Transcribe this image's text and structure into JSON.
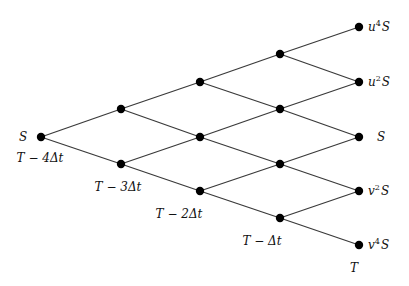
{
  "diagram": {
    "type": "binomial-tree",
    "steps": 4,
    "root_label": "S",
    "root_time_label": "T − 4Δt",
    "time_labels": [
      {
        "text": "T − 4Δt",
        "x": 40,
        "y": 162
      },
      {
        "text": "T − 3Δt",
        "x": 118,
        "y": 191
      },
      {
        "text": "T − 2Δt",
        "x": 179,
        "y": 218
      },
      {
        "text": "T − Δt",
        "x": 262,
        "y": 245
      },
      {
        "text": "T",
        "x": 354,
        "y": 272
      }
    ],
    "terminal_labels": [
      {
        "base": "u",
        "exp": "4",
        "suffix": "S",
        "y": 27
      },
      {
        "base": "u",
        "exp": "2",
        "suffix": "S",
        "y": 82
      },
      {
        "base": "",
        "exp": "",
        "suffix": "S",
        "y": 137
      },
      {
        "base": "v",
        "exp": "2",
        "suffix": "S",
        "y": 191
      },
      {
        "base": "v",
        "exp": "4",
        "suffix": "S",
        "y": 245
      }
    ],
    "levels": [
      {
        "x": 41,
        "ys": [
          137
        ]
      },
      {
        "x": 121,
        "ys": [
          109,
          164
        ]
      },
      {
        "x": 200,
        "ys": [
          82,
          137,
          191
        ]
      },
      {
        "x": 280,
        "ys": [
          54,
          109,
          164,
          218
        ]
      },
      {
        "x": 359,
        "ys": [
          27,
          82,
          137,
          191,
          245
        ]
      }
    ],
    "colors": {
      "edge": "#3a3a3a",
      "node": "#000000",
      "text": "#111111"
    }
  }
}
